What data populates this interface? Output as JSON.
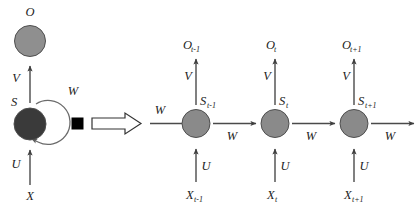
{
  "figure": {
    "background_color": "#ffffff"
  },
  "colors": {
    "output_node_fill": "#8f8f8f",
    "state_node_fill_folded": "#3a3a3a",
    "state_node_fill_unrolled": "#8a8a8a",
    "node_stroke": "#4f4f4f",
    "edge": "#4a4a4a",
    "loop_edge": "#6b6b6b",
    "square_node": "#000000",
    "text": "#1c1c1c"
  },
  "folded": {
    "output_node": {
      "label": "O",
      "name": "output-node"
    },
    "state_node": {
      "label": "S",
      "name": "state-node"
    },
    "input_node": {
      "label": "X",
      "name": "input-node"
    },
    "weight_output": "V",
    "weight_input": "U",
    "weight_recurrent": "W",
    "recurrent_square_label": ""
  },
  "transition": {
    "block_arrow_name": "unfold-block-arrow",
    "transition_weight": "W"
  },
  "unrolled": {
    "weights": {
      "output": "V",
      "input": "U",
      "recurrent": "W"
    },
    "steps": [
      {
        "index": 0,
        "output_label": "O",
        "output_sub": "t-1",
        "state_label": "S",
        "state_sub": "t-1",
        "input_label": "X",
        "input_sub": "t-1",
        "weight_output": "V",
        "weight_input": "U",
        "weight_recurrent_out": "W"
      },
      {
        "index": 1,
        "output_label": "O",
        "output_sub": "t",
        "state_label": "S",
        "state_sub": "t",
        "input_label": "X",
        "input_sub": "t",
        "weight_output": "V",
        "weight_input": "U",
        "weight_recurrent_out": "W"
      },
      {
        "index": 2,
        "output_label": "O",
        "output_sub": "t+1",
        "state_label": "S",
        "state_sub": "t+1",
        "input_label": "X",
        "input_sub": "t+1",
        "weight_output": "V",
        "weight_input": "U",
        "weight_recurrent_out": "W"
      }
    ]
  }
}
